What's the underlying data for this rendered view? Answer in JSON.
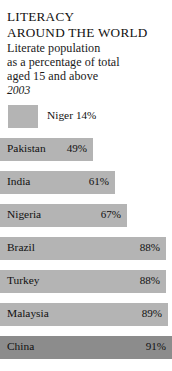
{
  "header": {
    "title_line1": "LITERACY",
    "title_line2": "AROUND THE WORLD",
    "subtitle_line1": "Literate population",
    "subtitle_line2": "as a percentage of total",
    "subtitle_line3": "aged 15 and above",
    "year": "2003"
  },
  "colors": {
    "bar_fill": "#b4b4b4",
    "bar_fill_dark": "#8c8c8c",
    "background": "#ffffff",
    "text": "#111111"
  },
  "chart_data": {
    "type": "bar",
    "title": "LITERACY AROUND THE WORLD",
    "subtitle": "Literate population as a percentage of total aged 15 and above",
    "year": "2003",
    "xlabel": "",
    "ylabel": "",
    "xlim": [
      0,
      100
    ],
    "unit": "%",
    "grid": false,
    "legend": "none",
    "orientation": "horizontal",
    "categories": [
      "Niger",
      "Pakistan",
      "India",
      "Nigeria",
      "Brazil",
      "Turkey",
      "Malaysia",
      "China"
    ],
    "values": [
      14,
      49,
      61,
      67,
      88,
      88,
      89,
      91
    ],
    "value_labels": [
      "14%",
      "49%",
      "61%",
      "67%",
      "88%",
      "88%",
      "89%",
      "91%"
    ],
    "bars": [
      {
        "name": "Niger",
        "value": 14,
        "value_label": "14%",
        "label_position": "outside",
        "indented": true,
        "shade": "light"
      },
      {
        "name": "Pakistan",
        "value": 49,
        "value_label": "49%",
        "label_position": "inside",
        "indented": false,
        "shade": "light"
      },
      {
        "name": "India",
        "value": 61,
        "value_label": "61%",
        "label_position": "inside",
        "indented": false,
        "shade": "light"
      },
      {
        "name": "Nigeria",
        "value": 67,
        "value_label": "67%",
        "label_position": "inside",
        "indented": false,
        "shade": "light"
      },
      {
        "name": "Brazil",
        "value": 88,
        "value_label": "88%",
        "label_position": "inside",
        "indented": false,
        "shade": "light"
      },
      {
        "name": "Turkey",
        "value": 88,
        "value_label": "88%",
        "label_position": "inside",
        "indented": false,
        "shade": "light"
      },
      {
        "name": "Malaysia",
        "value": 89,
        "value_label": "89%",
        "label_position": "inside",
        "indented": false,
        "shade": "light"
      },
      {
        "name": "China",
        "value": 91,
        "value_label": "91%",
        "label_position": "inside",
        "indented": false,
        "shade": "dark"
      }
    ]
  }
}
